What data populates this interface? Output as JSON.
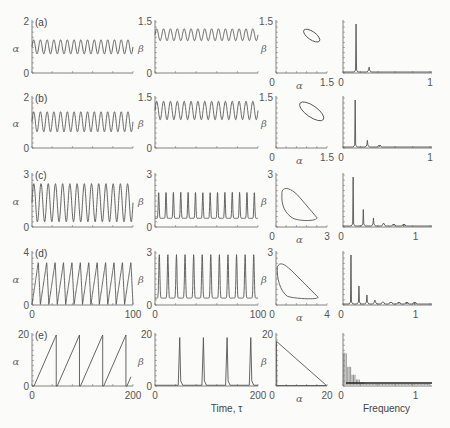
{
  "figure": {
    "x_label_time": "Time, τ",
    "x_label_freq": "Frequency",
    "alpha_symbol": "α",
    "beta_symbol": "β"
  },
  "chart_data": [
    {
      "panel": "a",
      "type": "line",
      "column": "alpha-time",
      "ylabel": "α",
      "ylim": [
        0,
        2
      ],
      "yticks": [
        "0",
        "2"
      ],
      "xlim": [
        0,
        100
      ],
      "oscillation": {
        "min": 0.75,
        "max": 1.3,
        "cycles": 15
      }
    },
    {
      "panel": "a",
      "type": "line",
      "column": "beta-time",
      "ylabel": "β",
      "ylim": [
        0,
        1.5
      ],
      "yticks": [
        "0",
        "1.5"
      ],
      "xlim": [
        0,
        100
      ],
      "oscillation": {
        "min": 0.95,
        "max": 1.3,
        "cycles": 15
      }
    },
    {
      "panel": "a",
      "type": "line",
      "column": "phase",
      "xlabel": "α",
      "ylabel": "β",
      "xlim": [
        0,
        1.5
      ],
      "ylim": [
        0,
        1.5
      ],
      "xticks": [
        "0",
        "1.5"
      ],
      "yticks": [
        "1.5"
      ],
      "loop": {
        "cx": 1.05,
        "cy": 1.1,
        "rx": 0.28,
        "ry": 0.12,
        "angle": 35
      }
    },
    {
      "panel": "a",
      "type": "bar",
      "column": "spectrum",
      "xlim": [
        0,
        1
      ],
      "xticks": [
        "0",
        "1"
      ],
      "peaks": [
        {
          "f": 0.15,
          "h": 1.0
        },
        {
          "f": 0.3,
          "h": 0.12
        }
      ]
    },
    {
      "panel": "b",
      "type": "line",
      "column": "alpha-time",
      "ylabel": "α",
      "ylim": [
        0,
        2
      ],
      "yticks": [
        "0",
        "2"
      ],
      "xlim": [
        0,
        100
      ],
      "oscillation": {
        "min": 0.65,
        "max": 1.45,
        "cycles": 15
      }
    },
    {
      "panel": "b",
      "type": "line",
      "column": "beta-time",
      "ylabel": "β",
      "ylim": [
        0,
        1.5
      ],
      "yticks": [
        "0",
        "1.5"
      ],
      "xlim": [
        0,
        100
      ],
      "oscillation": {
        "min": 0.85,
        "max": 1.4,
        "cycles": 15
      }
    },
    {
      "panel": "b",
      "type": "line",
      "column": "phase",
      "xlabel": "α",
      "ylabel": "β",
      "xlim": [
        0,
        1.5
      ],
      "ylim": [
        0,
        1.5
      ],
      "xticks": [
        "0",
        "1.5"
      ],
      "yticks": [
        "1.5"
      ],
      "loop": {
        "cx": 1.05,
        "cy": 1.1,
        "rx": 0.42,
        "ry": 0.17,
        "angle": 35
      }
    },
    {
      "panel": "b",
      "type": "bar",
      "column": "spectrum",
      "xlim": [
        0,
        1
      ],
      "xticks": [
        "0",
        "1"
      ],
      "peaks": [
        {
          "f": 0.14,
          "h": 1.0
        },
        {
          "f": 0.28,
          "h": 0.16
        },
        {
          "f": 0.42,
          "h": 0.03
        }
      ]
    },
    {
      "panel": "c",
      "type": "line",
      "column": "alpha-time",
      "ylabel": "α",
      "ylim": [
        0,
        3
      ],
      "yticks": [
        "0",
        "3"
      ],
      "xlim": [
        0,
        100
      ],
      "oscillation": {
        "min": 0.3,
        "max": 2.5,
        "cycles": 14
      }
    },
    {
      "panel": "c",
      "type": "line",
      "column": "beta-time",
      "ylabel": "β",
      "ylim": [
        0,
        3
      ],
      "yticks": [
        "0",
        "3"
      ],
      "xlim": [
        0,
        100
      ],
      "oscillation": {
        "min": 0.5,
        "max": 2.0,
        "cycles": 14
      }
    },
    {
      "panel": "c",
      "type": "line",
      "column": "phase",
      "xlabel": "α",
      "ylabel": "β",
      "xlim": [
        0,
        3
      ],
      "ylim": [
        0,
        3
      ],
      "xticks": [
        "0",
        "3"
      ],
      "yticks": [
        "3"
      ]
    },
    {
      "panel": "c",
      "type": "bar",
      "column": "spectrum",
      "xlim": [
        0,
        1.2
      ],
      "xticks": [
        "0",
        "1"
      ],
      "peaks": [
        {
          "f": 0.14,
          "h": 1.0
        },
        {
          "f": 0.28,
          "h": 0.35
        },
        {
          "f": 0.42,
          "h": 0.18
        },
        {
          "f": 0.56,
          "h": 0.08
        },
        {
          "f": 0.7,
          "h": 0.03
        },
        {
          "f": 0.84,
          "h": 0.01
        }
      ]
    },
    {
      "panel": "d",
      "type": "line",
      "column": "alpha-time",
      "ylabel": "α",
      "ylim": [
        0,
        4
      ],
      "yticks": [
        "0",
        "4"
      ],
      "xlim": [
        0,
        100
      ],
      "xticks": [
        "0",
        "100"
      ],
      "oscillation": {
        "min": 0.05,
        "max": 3.3,
        "cycles": 12
      }
    },
    {
      "panel": "d",
      "type": "line",
      "column": "beta-time",
      "ylabel": "β",
      "ylim": [
        0,
        3
      ],
      "yticks": [
        "0",
        "3"
      ],
      "xlim": [
        0,
        100
      ],
      "xticks": [
        "0",
        "100"
      ],
      "oscillation": {
        "min": 0.4,
        "max": 2.9,
        "cycles": 12
      }
    },
    {
      "panel": "d",
      "type": "line",
      "column": "phase",
      "xlabel": "α",
      "ylabel": "β",
      "xlim": [
        0,
        4
      ],
      "ylim": [
        0,
        3
      ],
      "xticks": [
        "0",
        "4"
      ],
      "yticks": [
        "3"
      ]
    },
    {
      "panel": "d",
      "type": "bar",
      "column": "spectrum",
      "xlim": [
        0,
        1.2
      ],
      "xticks": [
        "0",
        "1"
      ],
      "peaks": [
        {
          "f": 0.11,
          "h": 1.0
        },
        {
          "f": 0.22,
          "h": 0.38
        },
        {
          "f": 0.33,
          "h": 0.2
        },
        {
          "f": 0.44,
          "h": 0.1
        },
        {
          "f": 0.55,
          "h": 0.06
        },
        {
          "f": 0.66,
          "h": 0.04
        },
        {
          "f": 0.77,
          "h": 0.03
        },
        {
          "f": 0.88,
          "h": 0.02
        },
        {
          "f": 0.99,
          "h": 0.01
        }
      ]
    },
    {
      "panel": "e",
      "type": "line",
      "column": "alpha-time",
      "ylabel": "α",
      "ylim": [
        0,
        20
      ],
      "yticks": [
        "0",
        "20"
      ],
      "xlim": [
        0,
        200
      ],
      "xticks": [
        "0",
        "200"
      ],
      "sawtooth": {
        "period": 46,
        "max": 20
      }
    },
    {
      "panel": "e",
      "type": "line",
      "column": "beta-time",
      "ylabel": "β",
      "ylim": [
        0,
        20
      ],
      "yticks": [
        "0",
        "20"
      ],
      "xlim": [
        0,
        200
      ],
      "xticks": [
        "0",
        "200"
      ],
      "xlabel": "Time, τ",
      "spikes": [
        48,
        94,
        140,
        186
      ]
    },
    {
      "panel": "e",
      "type": "line",
      "column": "phase",
      "xlabel": "α",
      "ylabel": "β",
      "xlim": [
        0,
        20
      ],
      "ylim": [
        0,
        20
      ],
      "xticks": [
        "0",
        "20"
      ],
      "yticks": [
        "20"
      ]
    },
    {
      "panel": "e",
      "type": "bar",
      "column": "spectrum",
      "xlim": [
        0,
        1.2
      ],
      "xticks": [
        "0",
        "1"
      ],
      "xlabel": "Frequency",
      "decay": "dense harmonic comb decaying from f≈0"
    }
  ]
}
